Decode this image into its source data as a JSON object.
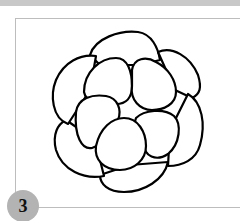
{
  "figure": {
    "step_number": "3",
    "colors": {
      "top_bar": "#c8c8c8",
      "frame_border": "#bdbdbd",
      "badge_background": "#b3b3b3",
      "outline": "#000000",
      "background": "#ffffff"
    }
  }
}
